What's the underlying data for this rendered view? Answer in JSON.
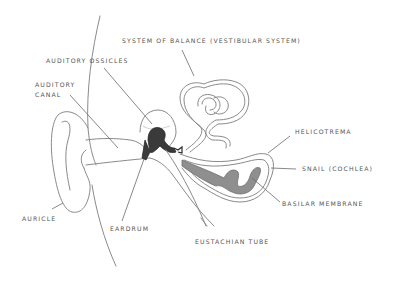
{
  "diagram": {
    "colors": {
      "background": "#ffffff",
      "outline": "#8a8a8a",
      "label_text": "#555555",
      "ossicles_fill": "#3a3a3a",
      "cochlea_fill": "#8f8f8f"
    },
    "labels": {
      "vestibular": "SYSTEM OF BALANCE (VESTIBULAR SYSTEM)",
      "ossicles": "AUDITORY OSSICLES",
      "canal_line1": "AUDITORY",
      "canal_line2": "CANAL",
      "helicotrema": "HELICOTREMA",
      "cochlea": "SNAIL (COCHLEA)",
      "basilar": "BASILAR MEMBRANE",
      "auricle": "AURICLE",
      "eardrum": "EARDRUM",
      "eustachian": "EUSTACHIAN TUBE"
    }
  }
}
